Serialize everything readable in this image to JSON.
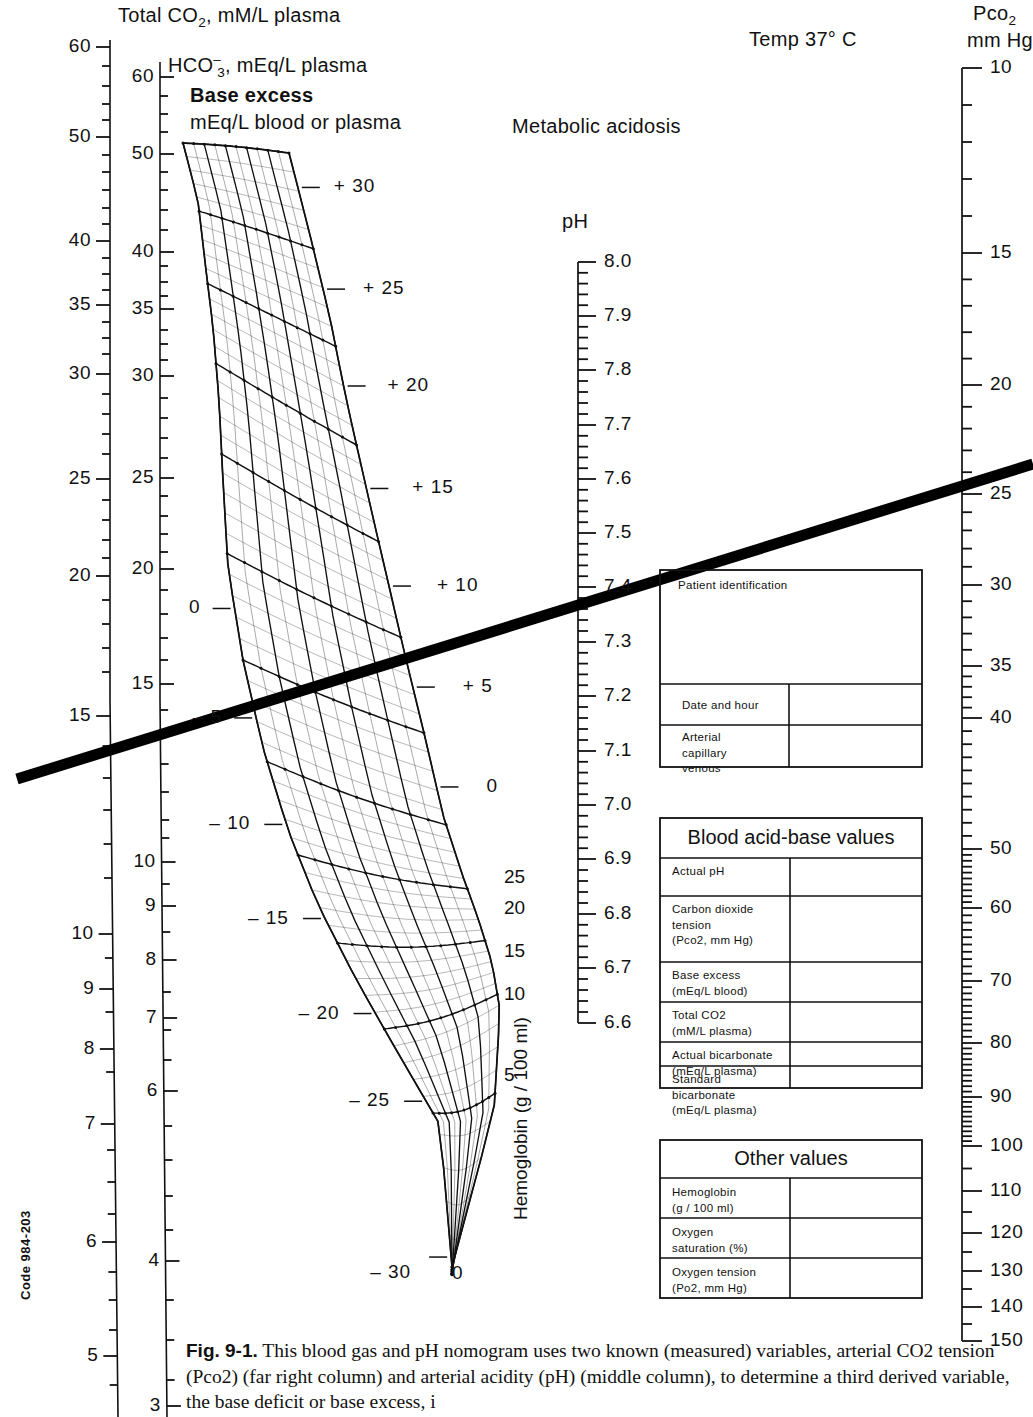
{
  "figure": {
    "id": "Fig. 9-1.",
    "caption": "This blood gas and pH nomogram uses two known (measured) variables, arterial CO2 tension (Pco2) (far right column) and arterial acidity (pH) (middle column), to determine a third derived variable, the base deficit or base excess, i",
    "code": "Code 984-203",
    "temp": "Temp 37° C",
    "annotation": "Metabolic acidosis"
  },
  "axes": {
    "total_co2": {
      "title_line1": "Total CO",
      "title_sub": "2",
      "title_line2": ", mM/L plasma",
      "labels": [
        "60",
        "50",
        "40",
        "35",
        "30",
        "25",
        "20",
        "15",
        "10",
        "9",
        "8",
        "7",
        "6",
        "5"
      ]
    },
    "bicarbonate": {
      "title_pre": "HCO",
      "title_sup": "–",
      "title_sub": "3",
      "title_post": ", mEq/L plasma",
      "labels": [
        "60",
        "50",
        "40",
        "35",
        "30",
        "25",
        "20",
        "15",
        "10",
        "9",
        "8",
        "7",
        "6",
        "4",
        "3"
      ]
    },
    "ph": {
      "title": "pH",
      "labels": [
        "8.0",
        "7.9",
        "7.8",
        "7.7",
        "7.6",
        "7.5",
        "7.4",
        "7.3",
        "7.2",
        "7.1",
        "7.0",
        "6.9",
        "6.8",
        "6.7",
        "6.6"
      ]
    },
    "pco2": {
      "title_line1": "Pco",
      "title_sub": "2",
      "title_line2": "mm Hg",
      "labels": [
        "10",
        "15",
        "20",
        "25",
        "30",
        "35",
        "40",
        "50",
        "60",
        "70",
        "80",
        "90",
        "100",
        "110",
        "120",
        "130",
        "140",
        "150"
      ]
    },
    "base_excess": {
      "title_line1": "Base excess",
      "title_line2": "mEq/L blood or plasma",
      "labels": [
        "+ 30",
        "+ 25",
        "+ 20",
        "+ 15",
        "+ 10",
        "+ 5",
        "0",
        "0",
        "– 5",
        "– 10",
        "– 15",
        "– 20",
        "– 25",
        "– 30"
      ]
    },
    "hemoglobin": {
      "title": "Hemoglobin (g / 100 ml)",
      "labels": [
        "25",
        "20",
        "15",
        "10",
        "5",
        "0"
      ]
    }
  },
  "boxes": {
    "patient": {
      "title": "Patient identification",
      "rows": [
        {
          "label": "Date and hour",
          "value": ""
        },
        {
          "label": "Arterial\ncapillary\nvenous",
          "value": ""
        }
      ]
    },
    "acid_base": {
      "title": "Blood acid-base values",
      "rows": [
        {
          "label": "Actual pH",
          "value": ""
        },
        {
          "label": "Carbon dioxide\ntension\n(Pco2, mm Hg)",
          "value": ""
        },
        {
          "label": "Base excess\n(mEq/L blood)",
          "value": ""
        },
        {
          "label": "Total CO2\n(mM/L plasma)",
          "value": ""
        },
        {
          "label": "Actual bicarbonate\n(mEq/L plasma)",
          "value": ""
        },
        {
          "label": "Standard bicarbonate\n(mEq/L plasma)",
          "value": ""
        }
      ]
    },
    "other": {
      "title": "Other values",
      "rows": [
        {
          "label": "Hemoglobin\n(g / 100 ml)",
          "value": ""
        },
        {
          "label": "Oxygen\nsaturation (%)",
          "value": ""
        },
        {
          "label": "Oxygen tension\n(Po2, mm Hg)",
          "value": ""
        }
      ]
    }
  },
  "chart_data": {
    "type": "line",
    "reading_line": {
      "x1": 17,
      "y1": 779,
      "x2": 1033,
      "y2": 464,
      "ph": 7.35,
      "pco2": 24,
      "base_excess": -11,
      "total_co2": 14.5,
      "hco3": 13.5
    },
    "scales": [
      {
        "name": "Total CO2, mM/L plasma",
        "x": 110,
        "ticks": [
          {
            "v": "60",
            "y": 47
          },
          {
            "v": "50",
            "y": 137
          },
          {
            "v": "40",
            "y": 241
          },
          {
            "v": "35",
            "y": 305
          },
          {
            "v": "30",
            "y": 374
          },
          {
            "v": "25",
            "y": 479
          },
          {
            "v": "20",
            "y": 576
          },
          {
            "v": "15",
            "y": 716
          },
          {
            "v": "10",
            "y": 934
          },
          {
            "v": "9",
            "y": 989
          },
          {
            "v": "8",
            "y": 1049
          },
          {
            "v": "7",
            "y": 1124
          },
          {
            "v": "6",
            "y": 1242
          },
          {
            "v": "5",
            "y": 1356
          }
        ]
      },
      {
        "name": "HCO3-, mEq/L plasma",
        "x": 160,
        "ticks": [
          {
            "v": "60",
            "y": 77
          },
          {
            "v": "50",
            "y": 154
          },
          {
            "v": "40",
            "y": 252
          },
          {
            "v": "35",
            "y": 309
          },
          {
            "v": "30",
            "y": 376
          },
          {
            "v": "25",
            "y": 478
          },
          {
            "v": "20",
            "y": 569
          },
          {
            "v": "15",
            "y": 684
          },
          {
            "v": "10",
            "y": 862
          },
          {
            "v": "9",
            "y": 906
          },
          {
            "v": "8",
            "y": 960
          },
          {
            "v": "7",
            "y": 1018
          },
          {
            "v": "6",
            "y": 1091
          },
          {
            "v": "4",
            "y": 1261
          },
          {
            "v": "3",
            "y": 1406
          }
        ]
      },
      {
        "name": "pH",
        "x": 590,
        "ticks": [
          {
            "v": "8.0",
            "y": 262
          },
          {
            "v": "7.9",
            "y": 316
          },
          {
            "v": "7.8",
            "y": 370
          },
          {
            "v": "7.7",
            "y": 425
          },
          {
            "v": "7.6",
            "y": 479
          },
          {
            "v": "7.5",
            "y": 533
          },
          {
            "v": "7.4",
            "y": 587
          },
          {
            "v": "7.3",
            "y": 642
          },
          {
            "v": "7.2",
            "y": 696
          },
          {
            "v": "7.1",
            "y": 751
          },
          {
            "v": "7.0",
            "y": 805
          },
          {
            "v": "6.9",
            "y": 859
          },
          {
            "v": "6.8",
            "y": 914
          },
          {
            "v": "6.7",
            "y": 968
          },
          {
            "v": "6.6",
            "y": 1023
          }
        ]
      },
      {
        "name": "Pco2, mm Hg",
        "x": 968,
        "ticks": [
          {
            "v": "10",
            "y": 68
          },
          {
            "v": "15",
            "y": 253
          },
          {
            "v": "20",
            "y": 385
          },
          {
            "v": "25",
            "y": 494
          },
          {
            "v": "30",
            "y": 585
          },
          {
            "v": "35",
            "y": 666
          },
          {
            "v": "40",
            "y": 718
          },
          {
            "v": "50",
            "y": 849
          },
          {
            "v": "60",
            "y": 908
          },
          {
            "v": "70",
            "y": 981
          },
          {
            "v": "80",
            "y": 1043
          },
          {
            "v": "90",
            "y": 1097
          },
          {
            "v": "100",
            "y": 1146
          },
          {
            "v": "110",
            "y": 1191
          },
          {
            "v": "120",
            "y": 1233
          },
          {
            "v": "130",
            "y": 1271
          },
          {
            "v": "140",
            "y": 1307
          },
          {
            "v": "150",
            "y": 1341
          }
        ]
      }
    ],
    "base_excess_values": [
      30,
      25,
      20,
      15,
      10,
      5,
      0,
      -5,
      -10,
      -15,
      -20,
      -25,
      -30
    ],
    "hemoglobin_values": [
      25,
      20,
      15,
      10,
      5,
      0
    ]
  }
}
